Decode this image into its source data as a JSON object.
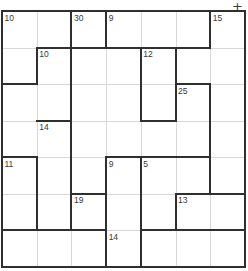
{
  "puzzle": {
    "title": "Killer-style cage grid",
    "grid": {
      "columns": 7,
      "rows": 7,
      "origin_x": 2,
      "origin_y": 11,
      "cell_width": 34.71,
      "cell_height": 36.57
    },
    "corner_marker": {
      "name": "plus-marker",
      "glyph": "+",
      "x": 237,
      "y": 6
    },
    "colors": {
      "background": "#ffffff",
      "light_grid_line": "#d8d8d8",
      "bold_cage_line": "#2f2f2f",
      "clue_text": "#38383a"
    },
    "clues": [
      {
        "id": "clue-10-r1c1",
        "value": "10",
        "col": 0,
        "row": 0
      },
      {
        "id": "clue-30-r1c3",
        "value": "30",
        "col": 2,
        "row": 0
      },
      {
        "id": "clue-9-r1c4",
        "value": "9",
        "col": 3,
        "row": 0
      },
      {
        "id": "clue-15-r1c7",
        "value": "15",
        "col": 6,
        "row": 0
      },
      {
        "id": "clue-10-r2c2",
        "value": "10",
        "col": 1,
        "row": 1
      },
      {
        "id": "clue-12-r2c5",
        "value": "12",
        "col": 4,
        "row": 1
      },
      {
        "id": "clue-25-r3c6",
        "value": "25",
        "col": 5,
        "row": 2
      },
      {
        "id": "clue-14-r4c2",
        "value": "14",
        "col": 1,
        "row": 3
      },
      {
        "id": "clue-11-r5c1",
        "value": "11",
        "col": 0,
        "row": 4
      },
      {
        "id": "clue-9-r5c4",
        "value": "9",
        "col": 3,
        "row": 4
      },
      {
        "id": "clue-5-r5c5",
        "value": "5",
        "col": 4,
        "row": 4
      },
      {
        "id": "clue-19-r6c3",
        "value": "19",
        "col": 2,
        "row": 5
      },
      {
        "id": "clue-13-r6c6",
        "value": "13",
        "col": 5,
        "row": 5
      },
      {
        "id": "clue-14-r7c4",
        "value": "14",
        "col": 3,
        "row": 6
      }
    ],
    "light_vertical_lines": [
      1,
      2,
      3,
      4,
      5,
      6
    ],
    "light_horizontal_lines": [
      1,
      2,
      3,
      4,
      5,
      6
    ],
    "bold_vertical_segments": [
      {
        "col": 0,
        "row_start": 0,
        "row_end": 7
      },
      {
        "col": 7,
        "row_start": 0,
        "row_end": 7
      },
      {
        "col": 2,
        "row_start": 0,
        "row_end": 6
      },
      {
        "col": 3,
        "row_start": 0,
        "row_end": 1
      },
      {
        "col": 1,
        "row_start": 1,
        "row_end": 2
      },
      {
        "col": 4,
        "row_start": 1,
        "row_end": 3
      },
      {
        "col": 5,
        "row_start": 1,
        "row_end": 2
      },
      {
        "col": 6,
        "row_start": 0,
        "row_end": 1
      },
      {
        "col": 5,
        "row_start": 2,
        "row_end": 3
      },
      {
        "col": 6,
        "row_start": 2,
        "row_end": 4
      },
      {
        "col": 2,
        "row_start": 3,
        "row_end": 6
      },
      {
        "col": 1,
        "row_start": 4,
        "row_end": 6
      },
      {
        "col": 3,
        "row_start": 4,
        "row_end": 7
      },
      {
        "col": 4,
        "row_start": 4,
        "row_end": 7
      },
      {
        "col": 6,
        "row_start": 4,
        "row_end": 5
      },
      {
        "col": 5,
        "row_start": 5,
        "row_end": 6
      },
      {
        "col": 3,
        "row_start": 6,
        "row_end": 7
      }
    ],
    "bold_horizontal_segments": [
      {
        "row": 0,
        "col_start": 0,
        "col_end": 7
      },
      {
        "row": 7,
        "col_start": 0,
        "col_end": 7
      },
      {
        "row": 1,
        "col_start": 1,
        "col_end": 3
      },
      {
        "row": 1,
        "col_start": 3,
        "col_end": 6
      },
      {
        "row": 2,
        "col_start": 0,
        "col_end": 1
      },
      {
        "row": 2,
        "col_start": 5,
        "col_end": 6
      },
      {
        "row": 3,
        "col_start": 1,
        "col_end": 2
      },
      {
        "row": 3,
        "col_start": 4,
        "col_end": 5
      },
      {
        "row": 4,
        "col_start": 0,
        "col_end": 1
      },
      {
        "row": 4,
        "col_start": 3,
        "col_end": 6
      },
      {
        "row": 5,
        "col_start": 2,
        "col_end": 3
      },
      {
        "row": 5,
        "col_start": 5,
        "col_end": 7
      },
      {
        "row": 6,
        "col_start": 0,
        "col_end": 3
      },
      {
        "row": 6,
        "col_start": 4,
        "col_end": 7
      }
    ]
  }
}
